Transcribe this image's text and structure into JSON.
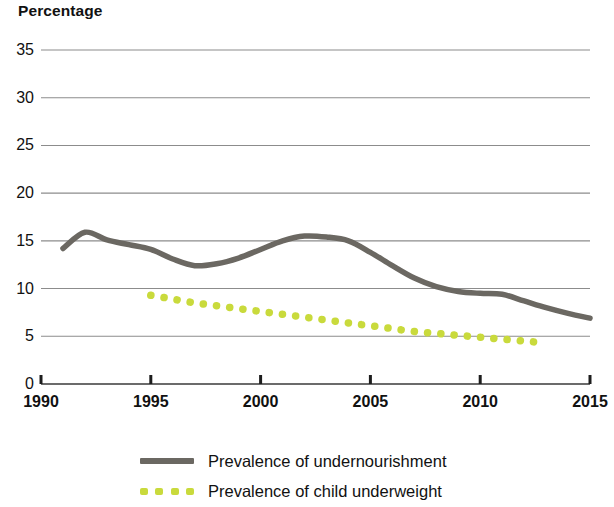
{
  "chart_data": {
    "type": "line",
    "title": "",
    "ylabel": "Percentage",
    "xlabel": "",
    "xlim": [
      1990,
      2015
    ],
    "ylim": [
      0,
      35
    ],
    "grid": true,
    "legend_position": "bottom",
    "x_ticks": [
      "1990",
      "1995",
      "2000",
      "2005",
      "2010",
      "2015"
    ],
    "y_ticks": [
      "0",
      "5",
      "10",
      "15",
      "20",
      "25",
      "30",
      "35"
    ],
    "series": [
      {
        "name": "Prevalence of undernourishment",
        "color": "#6b6862",
        "style": "solid",
        "x": [
          1991,
          1992,
          1993,
          1994,
          1995,
          1996,
          1997,
          1998,
          1999,
          2000,
          2001,
          2002,
          2003,
          2004,
          2005,
          2006,
          2007,
          2008,
          2009,
          2010,
          2011,
          2012,
          2013,
          2014,
          2015
        ],
        "values": [
          14.2,
          15.9,
          15.1,
          14.6,
          14.1,
          13.1,
          12.4,
          12.6,
          13.2,
          14.1,
          15.0,
          15.5,
          15.4,
          15.0,
          13.8,
          12.4,
          11.1,
          10.2,
          9.7,
          9.5,
          9.4,
          8.7,
          8.0,
          7.4,
          6.9
        ]
      },
      {
        "name": "Prevalence of child underweight",
        "color": "#c9da3c",
        "style": "dotted",
        "x": [
          1995,
          1996,
          1997,
          1998,
          1999,
          2000,
          2001,
          2002,
          2003,
          2004,
          2005,
          2006,
          2007,
          2008,
          2009,
          2010,
          2011,
          2012,
          2013
        ],
        "values": [
          9.3,
          8.9,
          8.5,
          8.2,
          7.9,
          7.6,
          7.3,
          7.0,
          6.7,
          6.4,
          6.1,
          5.8,
          5.5,
          5.3,
          5.1,
          4.9,
          4.7,
          4.5,
          4.3
        ]
      }
    ]
  },
  "axis": {
    "y_title": "Percentage"
  },
  "legend": {
    "items": [
      {
        "label": "Prevalence of undernourishment",
        "color": "#6b6862",
        "style": "solid"
      },
      {
        "label": "Prevalence of child underweight",
        "color": "#c9da3c",
        "style": "dotted"
      }
    ]
  },
  "colors": {
    "undernourishment": "#6b6862",
    "child_underweight": "#c9da3c",
    "gridline": "#8c8c8c",
    "axis": "#3a3a3a",
    "text": "#111111"
  }
}
